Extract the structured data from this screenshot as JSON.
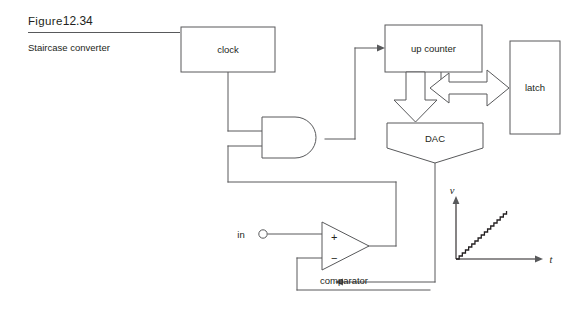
{
  "figure": {
    "label_word": "Figure",
    "number": "12.34",
    "caption": "Staircase converter"
  },
  "blocks": [
    {
      "id": "clock",
      "label": "clock",
      "shape": "rectangle"
    },
    {
      "id": "up_counter",
      "label": "up counter",
      "shape": "rectangle"
    },
    {
      "id": "latch",
      "label": "latch",
      "shape": "rectangle"
    },
    {
      "id": "dac",
      "label": "DAC",
      "shape": "pentagon-down"
    },
    {
      "id": "and_gate",
      "label": "",
      "shape": "and-gate"
    },
    {
      "id": "comparator",
      "label": "comparator",
      "shape": "triangle"
    }
  ],
  "terminals": [
    {
      "id": "input",
      "label": "in",
      "marker": "open-circle"
    }
  ],
  "comparator_inputs": {
    "plus": "+",
    "minus": "−"
  },
  "graph": {
    "y_axis_label": "v",
    "x_axis_label": "t",
    "waveform": "staircase-ramp",
    "steps": 16
  },
  "colors": {
    "line": "#58595b",
    "text": "#231f20",
    "wave": "#231f20",
    "background": "#ffffff"
  },
  "chart_data": {
    "type": "line",
    "title": "",
    "xlabel": "t",
    "ylabel": "v",
    "x": [
      0,
      1,
      2,
      3,
      4,
      5,
      6,
      7,
      8,
      9,
      10,
      11,
      12,
      13,
      14,
      15,
      16
    ],
    "values": [
      0,
      1,
      2,
      3,
      4,
      5,
      6,
      7,
      8,
      9,
      10,
      11,
      12,
      13,
      14,
      15,
      16
    ],
    "xlim": [
      0,
      19
    ],
    "ylim": [
      0,
      18
    ],
    "grid": false,
    "legend": "none",
    "step_style": "post"
  }
}
